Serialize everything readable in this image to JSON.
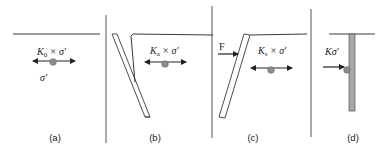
{
  "colors": {
    "line": "#3a3a3a",
    "divider": "#555555",
    "particle": "#8c8c8c",
    "pile": "#a8a8a8",
    "text": "#222222"
  },
  "panels": [
    {
      "id": "a",
      "caption": "(a)",
      "stress_label": {
        "k": "K",
        "sub": "0",
        "rest": " × σ′"
      },
      "vertical_label": "σ′"
    },
    {
      "id": "b",
      "caption": "(b)",
      "stress_label": {
        "k": "K",
        "sub": "a",
        "rest": " × σ′"
      }
    },
    {
      "id": "c",
      "caption": "(c)",
      "force_label": "F",
      "stress_label": {
        "k": "K",
        "sub": "s",
        "rest": " × σ′"
      }
    },
    {
      "id": "d",
      "caption": "(d)",
      "stress_label": {
        "k": "Kσ′"
      }
    }
  ]
}
